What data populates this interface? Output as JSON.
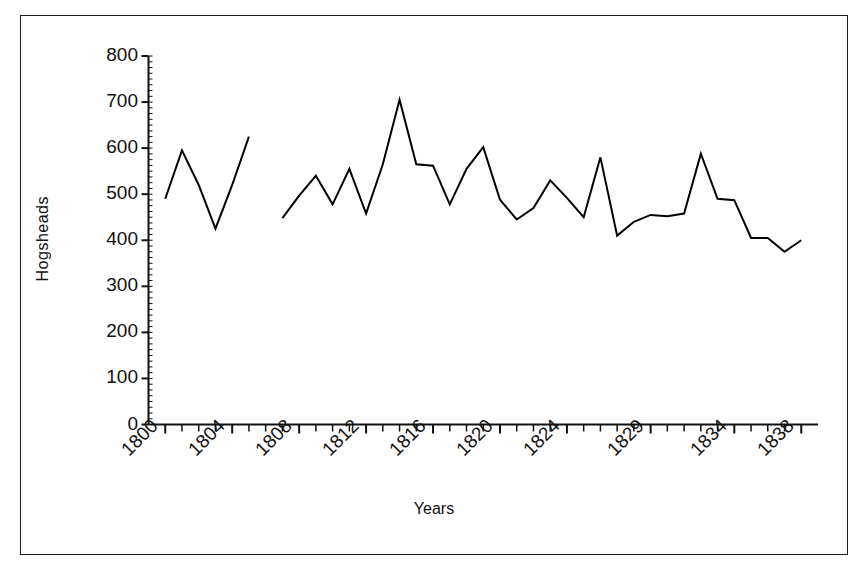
{
  "chart_data": {
    "type": "line",
    "title": "",
    "xlabel": "Years",
    "ylabel": "Hogsheads",
    "ylim": [
      0,
      800
    ],
    "ytick_labels": [
      "0",
      "100",
      "200",
      "300",
      "400",
      "500",
      "600",
      "700",
      "800"
    ],
    "ytick_values": [
      0,
      100,
      200,
      300,
      400,
      500,
      600,
      700,
      800
    ],
    "xlim": [
      1799,
      1839
    ],
    "xtick_labels": [
      "1800",
      "1804",
      "1808",
      "1812",
      "1816",
      "1820",
      "1824",
      "1829",
      "1834",
      "1838"
    ],
    "xtick_values": [
      1800,
      1804,
      1808,
      1812,
      1816,
      1820,
      1824,
      1829,
      1834,
      1838
    ],
    "grid": false,
    "legend": null,
    "line_color": "#000000",
    "line_width": 2,
    "markers": false,
    "has_data_gap": true,
    "series": [
      {
        "name": "Hogsheads",
        "x": [
          1800,
          1801,
          1802,
          1803,
          1804,
          1805
        ],
        "values": [
          490,
          595,
          520,
          425,
          520,
          625
        ]
      },
      {
        "name": "Hogsheads",
        "x": [
          1807,
          1808,
          1809,
          1810,
          1811,
          1812,
          1813,
          1814,
          1815,
          1816,
          1817,
          1818,
          1819,
          1820,
          1821,
          1822,
          1823,
          1824,
          1825,
          1826,
          1827,
          1828,
          1829,
          1830,
          1831,
          1832,
          1833,
          1834,
          1835,
          1836,
          1837,
          1838
        ],
        "values": [
          448,
          497,
          540,
          478,
          555,
          458,
          565,
          705,
          565,
          562,
          478,
          555,
          602,
          488,
          445,
          470,
          530,
          492,
          450,
          580,
          410,
          440,
          455,
          452,
          458,
          588,
          490,
          487,
          405,
          405,
          375,
          400
        ]
      }
    ]
  },
  "axis": {
    "x_title": "Years",
    "y_title": "Hogsheads"
  }
}
